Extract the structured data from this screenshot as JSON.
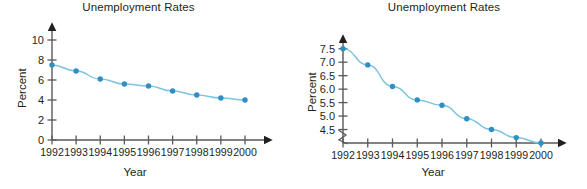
{
  "figure": {
    "panels": [
      {
        "id": "left",
        "title": "Unemployment Rates",
        "xlabel": "Year",
        "ylabel": "Percent"
      },
      {
        "id": "right",
        "title": "Unemployment Rates",
        "xlabel": "Year",
        "ylabel": "Percent"
      }
    ],
    "accent_color": "#2e8fc4",
    "line_color": "#7ec4e0",
    "axis_color": "#58595b",
    "text_color": "#231f20"
  },
  "chart_data": [
    {
      "type": "line",
      "title": "Unemployment Rates",
      "xlabel": "Year",
      "ylabel": "Percent",
      "categories": [
        "1992",
        "1993",
        "1994",
        "1995",
        "1996",
        "1997",
        "1998",
        "1999",
        "2000"
      ],
      "values": [
        7.5,
        6.9,
        6.1,
        5.6,
        5.4,
        4.9,
        4.5,
        4.2,
        4.0
      ],
      "ylim": [
        0,
        11
      ],
      "yticks": [
        0,
        2,
        4,
        6,
        8,
        10
      ],
      "ytick_labels": [
        "0",
        "2",
        "4",
        "6",
        "8",
        "10"
      ],
      "grid": false,
      "legend": null,
      "axis_break": false,
      "markers": true
    },
    {
      "type": "line",
      "title": "Unemployment Rates",
      "xlabel": "Year",
      "ylabel": "Percent",
      "categories": [
        "1992",
        "1993",
        "1994",
        "1995",
        "1996",
        "1997",
        "1998",
        "1999",
        "2000"
      ],
      "values": [
        7.5,
        6.9,
        6.1,
        5.6,
        5.4,
        4.9,
        4.5,
        4.2,
        4.0
      ],
      "ylim": [
        4.0,
        7.75
      ],
      "yticks": [
        4.5,
        5.0,
        5.5,
        6.0,
        6.5,
        7.0,
        7.5
      ],
      "ytick_labels": [
        "4.5",
        "5.0",
        "5.5",
        "6.0",
        "6.5",
        "7.0",
        "7.5"
      ],
      "grid": false,
      "legend": null,
      "axis_break": true,
      "markers": true
    }
  ]
}
